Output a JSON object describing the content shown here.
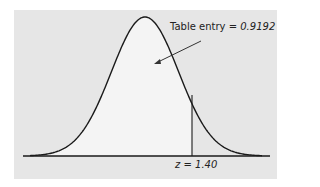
{
  "chart_data": {
    "type": "area",
    "title": "",
    "annotation": {
      "label": "Table entry",
      "equals": "=",
      "value": "0.9192"
    },
    "cutoff": {
      "label": "z",
      "equals": "=",
      "value": "1.40"
    },
    "shaded_region": "left of z = 1.40",
    "xlabel": "",
    "ylabel": "",
    "grid": false
  },
  "colors": {
    "panel": "#e6e6e6",
    "shaded": "#f4f4f4",
    "line": "#1a1a1a"
  }
}
